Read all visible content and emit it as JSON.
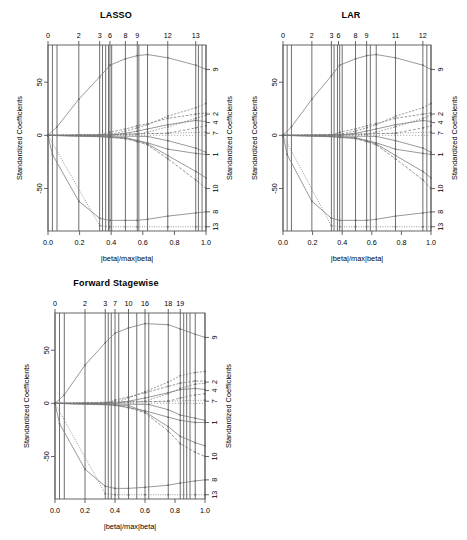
{
  "figure": {
    "background": "#ffffff",
    "width": 467,
    "height": 540,
    "axis_color": "#555555",
    "vline_color": "#4a4a4a",
    "path_color": "#777777"
  },
  "chart_data": [
    {
      "type": "line",
      "title": "LASSO",
      "xlabel": "|beta|/max|beta|",
      "ylabel": "Standardized Coefficients",
      "xlim": [
        0.0,
        1.0
      ],
      "ylim": [
        -90,
        85
      ],
      "grid": false,
      "legend": "right-axis-variable-index",
      "xticks": [
        0.0,
        0.2,
        0.4,
        0.6,
        0.8,
        1.0
      ],
      "xticklabels": [
        "0.0",
        "0.2",
        "0.4",
        "0.6",
        "0.8",
        "1.0"
      ],
      "yticks": [
        50,
        0,
        -50
      ],
      "yticklabels": [
        "50",
        "0",
        "-50"
      ],
      "top_axis_label": "Step",
      "top_ticks": [
        0.0,
        0.195,
        0.327,
        0.392,
        0.49,
        0.565,
        0.758,
        0.935
      ],
      "top_ticklabels": [
        "0",
        "2",
        "3",
        "6",
        "8",
        "9",
        "12",
        "13"
      ],
      "vlines": [
        0.0,
        0.028,
        0.057,
        0.195,
        0.327,
        0.345,
        0.365,
        0.383,
        0.392,
        0.403,
        0.49,
        0.565,
        0.575,
        0.63,
        0.758,
        0.935,
        0.952,
        0.975,
        1.0
      ],
      "right_ticks": [
        62,
        20,
        12,
        2,
        -18,
        -50,
        -72,
        -86
      ],
      "right_ticklabels": [
        "9",
        "2",
        "4",
        "7",
        "1",
        "10",
        "8",
        "13"
      ],
      "series": [
        {
          "name": "9",
          "x": [
            0.0,
            0.057,
            0.195,
            0.327,
            0.392,
            0.49,
            0.565,
            0.63,
            0.758,
            0.935,
            1.0
          ],
          "values": [
            0,
            8,
            34,
            55,
            66,
            72,
            75,
            76,
            73,
            66,
            62
          ]
        },
        {
          "name": "2",
          "x": [
            0.0,
            0.327,
            0.392,
            0.49,
            0.565,
            0.63,
            0.758,
            0.935,
            1.0
          ],
          "values": [
            0,
            0,
            3,
            6,
            9,
            11,
            16,
            20,
            21
          ]
        },
        {
          "name": "4",
          "x": [
            0.0,
            0.392,
            0.49,
            0.565,
            0.63,
            0.758,
            0.935,
            1.0
          ],
          "values": [
            0,
            0,
            2,
            4,
            6,
            10,
            14,
            13
          ]
        },
        {
          "name": "7",
          "x": [
            0.0,
            0.195,
            0.49,
            0.758,
            1.0
          ],
          "values": [
            0,
            0,
            1,
            2,
            3
          ]
        },
        {
          "name": "1",
          "x": [
            0.0,
            0.327,
            0.392,
            0.49,
            0.565,
            0.63,
            0.758,
            0.935,
            1.0
          ],
          "values": [
            0,
            -1,
            -2,
            -3,
            -5,
            -7,
            -13,
            -17,
            -18
          ]
        },
        {
          "name": "10",
          "x": [
            0.0,
            0.392,
            0.49,
            0.565,
            0.63,
            0.758,
            0.935,
            1.0
          ],
          "values": [
            0,
            -1,
            -3,
            -6,
            -9,
            -22,
            -42,
            -50
          ]
        },
        {
          "name": "8",
          "x": [
            0.0,
            0.028,
            0.195,
            0.327,
            0.392,
            0.49,
            0.565,
            0.63,
            0.758,
            0.935,
            1.0
          ],
          "values": [
            0,
            -18,
            -62,
            -78,
            -80,
            -80,
            -80,
            -79,
            -76,
            -73,
            -72
          ]
        },
        {
          "name": "13",
          "x": [
            0.0,
            0.327,
            0.392,
            0.49,
            0.565,
            0.758,
            0.935,
            1.0
          ],
          "values": [
            0,
            -85,
            -86,
            -86,
            -86,
            -86,
            -86,
            -86
          ]
        },
        {
          "name": "3",
          "x": [
            0.0,
            0.392,
            0.49,
            0.565,
            0.63,
            0.758,
            0.935,
            1.0
          ],
          "values": [
            0,
            1,
            4,
            7,
            10,
            18,
            26,
            30
          ]
        },
        {
          "name": "5",
          "x": [
            0.0,
            0.49,
            0.565,
            0.63,
            0.758,
            0.935,
            1.0
          ],
          "values": [
            0,
            -2,
            -5,
            -8,
            -19,
            -34,
            -40
          ]
        },
        {
          "name": "6",
          "x": [
            0.0,
            0.565,
            0.63,
            0.758,
            0.935,
            1.0
          ],
          "values": [
            0,
            1,
            3,
            8,
            16,
            19
          ]
        },
        {
          "name": "11",
          "x": [
            0.0,
            0.63,
            0.758,
            0.935,
            1.0
          ],
          "values": [
            0,
            -1,
            -5,
            -12,
            -16
          ]
        },
        {
          "name": "12",
          "x": [
            0.0,
            0.758,
            0.935,
            1.0
          ],
          "values": [
            0,
            2,
            7,
            9
          ]
        }
      ]
    },
    {
      "type": "line",
      "title": "LAR",
      "xlabel": "|beta|/max|beta|",
      "ylabel": "Standardized Coefficients",
      "xlim": [
        0.0,
        1.0
      ],
      "ylim": [
        -90,
        85
      ],
      "grid": false,
      "legend": "right-axis-variable-index",
      "xticks": [
        0.0,
        0.2,
        0.4,
        0.6,
        0.8,
        1.0
      ],
      "xticklabels": [
        "0.0",
        "0.2",
        "0.4",
        "0.6",
        "0.8",
        "1.0"
      ],
      "yticks": [
        50,
        0,
        -50
      ],
      "yticklabels": [
        "50",
        "0",
        "-50"
      ],
      "top_axis_label": "Step",
      "top_ticks": [
        0.0,
        0.195,
        0.327,
        0.375,
        0.49,
        0.565,
        0.76,
        0.945
      ],
      "top_ticklabels": [
        "0",
        "2",
        "3",
        "6",
        "8",
        "9",
        "11",
        "12"
      ],
      "vlines": [
        0.0,
        0.028,
        0.057,
        0.195,
        0.327,
        0.345,
        0.368,
        0.383,
        0.4,
        0.49,
        0.565,
        0.59,
        0.63,
        0.76,
        0.945,
        0.972,
        1.0
      ],
      "right_ticks": [
        62,
        20,
        12,
        2,
        -18,
        -50,
        -72,
        -86
      ],
      "right_ticklabels": [
        "9",
        "2",
        "4",
        "7",
        "1",
        "10",
        "8",
        "13"
      ],
      "series": [
        {
          "name": "9",
          "x": [
            0.0,
            0.057,
            0.195,
            0.327,
            0.383,
            0.49,
            0.565,
            0.63,
            0.76,
            0.945,
            1.0
          ],
          "values": [
            0,
            8,
            34,
            56,
            66,
            72,
            75,
            76,
            73,
            66,
            62
          ]
        },
        {
          "name": "2",
          "x": [
            0.0,
            0.327,
            0.383,
            0.49,
            0.565,
            0.63,
            0.76,
            0.945,
            1.0
          ],
          "values": [
            0,
            0,
            3,
            6,
            9,
            11,
            16,
            20,
            21
          ]
        },
        {
          "name": "4",
          "x": [
            0.0,
            0.383,
            0.49,
            0.565,
            0.63,
            0.76,
            0.945,
            1.0
          ],
          "values": [
            0,
            0,
            2,
            4,
            6,
            10,
            14,
            13
          ]
        },
        {
          "name": "7",
          "x": [
            0.0,
            0.195,
            0.49,
            0.76,
            1.0
          ],
          "values": [
            0,
            0,
            1,
            2,
            3
          ]
        },
        {
          "name": "1",
          "x": [
            0.0,
            0.327,
            0.383,
            0.49,
            0.565,
            0.63,
            0.76,
            0.945,
            1.0
          ],
          "values": [
            0,
            -1,
            -2,
            -3,
            -5,
            -7,
            -13,
            -17,
            -18
          ]
        },
        {
          "name": "10",
          "x": [
            0.0,
            0.383,
            0.49,
            0.565,
            0.63,
            0.76,
            0.945,
            1.0
          ],
          "values": [
            0,
            -1,
            -3,
            -6,
            -9,
            -22,
            -42,
            -50
          ]
        },
        {
          "name": "8",
          "x": [
            0.0,
            0.028,
            0.195,
            0.327,
            0.383,
            0.49,
            0.565,
            0.63,
            0.76,
            0.945,
            1.0
          ],
          "values": [
            0,
            -18,
            -62,
            -78,
            -80,
            -80,
            -80,
            -79,
            -76,
            -73,
            -72
          ]
        },
        {
          "name": "13",
          "x": [
            0.0,
            0.327,
            0.383,
            0.49,
            0.565,
            0.76,
            0.945,
            1.0
          ],
          "values": [
            0,
            -85,
            -86,
            -86,
            -86,
            -86,
            -86,
            -86
          ]
        },
        {
          "name": "3",
          "x": [
            0.0,
            0.383,
            0.49,
            0.565,
            0.63,
            0.76,
            0.945,
            1.0
          ],
          "values": [
            0,
            1,
            4,
            7,
            10,
            18,
            26,
            30
          ]
        },
        {
          "name": "5",
          "x": [
            0.0,
            0.49,
            0.565,
            0.63,
            0.76,
            0.945,
            1.0
          ],
          "values": [
            0,
            -2,
            -5,
            -8,
            -19,
            -34,
            -40
          ]
        },
        {
          "name": "6",
          "x": [
            0.0,
            0.565,
            0.63,
            0.76,
            0.945,
            1.0
          ],
          "values": [
            0,
            1,
            3,
            8,
            16,
            19
          ]
        },
        {
          "name": "11",
          "x": [
            0.0,
            0.63,
            0.76,
            0.945,
            1.0
          ],
          "values": [
            0,
            -1,
            -5,
            -12,
            -16
          ]
        },
        {
          "name": "12",
          "x": [
            0.0,
            0.76,
            0.945,
            1.0
          ],
          "values": [
            0,
            2,
            7,
            9
          ]
        }
      ]
    },
    {
      "type": "line",
      "title": "Forward Stagewise",
      "xlabel": "|beta|/max|beta|",
      "ylabel": "Standardized Coefficients",
      "xlim": [
        0.0,
        1.0
      ],
      "ylim": [
        -90,
        85
      ],
      "grid": false,
      "legend": "right-axis-variable-index",
      "xticks": [
        0.0,
        0.2,
        0.4,
        0.6,
        0.8,
        1.0
      ],
      "xticklabels": [
        "0.0",
        "0.2",
        "0.4",
        "0.6",
        "0.8",
        "1.0"
      ],
      "yticks": [
        50,
        0,
        -50
      ],
      "yticklabels": [
        "50",
        "0",
        "-50"
      ],
      "top_axis_label": "Step",
      "top_ticks": [
        0.0,
        0.2,
        0.335,
        0.4,
        0.49,
        0.6,
        0.755,
        0.835
      ],
      "top_ticklabels": [
        "0",
        "2",
        "3",
        "7",
        "10",
        "16",
        "18",
        "19"
      ],
      "vlines": [
        0.0,
        0.03,
        0.062,
        0.2,
        0.335,
        0.355,
        0.375,
        0.4,
        0.425,
        0.49,
        0.545,
        0.6,
        0.625,
        0.755,
        0.835,
        0.858,
        0.878,
        0.9,
        0.935,
        1.0
      ],
      "right_ticks": [
        62,
        20,
        12,
        2,
        -18,
        -50,
        -72,
        -86
      ],
      "right_ticklabels": [
        "9",
        "2",
        "4",
        "7",
        "1",
        "10",
        "8",
        "13"
      ],
      "series": [
        {
          "name": "9",
          "x": [
            0.0,
            0.062,
            0.2,
            0.335,
            0.4,
            0.49,
            0.6,
            0.755,
            0.835,
            0.935,
            1.0
          ],
          "values": [
            0,
            8,
            36,
            57,
            66,
            71,
            75,
            74,
            70,
            65,
            62
          ]
        },
        {
          "name": "2",
          "x": [
            0.0,
            0.335,
            0.4,
            0.49,
            0.6,
            0.755,
            0.835,
            0.935,
            1.0
          ],
          "values": [
            0,
            0,
            3,
            6,
            10,
            16,
            19,
            21,
            21
          ]
        },
        {
          "name": "4",
          "x": [
            0.0,
            0.4,
            0.49,
            0.6,
            0.755,
            0.835,
            0.935,
            1.0
          ],
          "values": [
            0,
            0,
            2,
            5,
            10,
            13,
            14,
            13
          ]
        },
        {
          "name": "7",
          "x": [
            0.0,
            0.2,
            0.49,
            0.755,
            1.0
          ],
          "values": [
            0,
            0,
            1,
            2,
            3
          ]
        },
        {
          "name": "1",
          "x": [
            0.0,
            0.335,
            0.4,
            0.49,
            0.6,
            0.755,
            0.835,
            0.935,
            1.0
          ],
          "values": [
            0,
            -1,
            -2,
            -4,
            -7,
            -13,
            -16,
            -18,
            -18
          ]
        },
        {
          "name": "10",
          "x": [
            0.0,
            0.4,
            0.49,
            0.6,
            0.755,
            0.835,
            0.935,
            1.0
          ],
          "values": [
            0,
            -1,
            -4,
            -9,
            -26,
            -38,
            -46,
            -50
          ]
        },
        {
          "name": "8",
          "x": [
            0.0,
            0.03,
            0.2,
            0.335,
            0.4,
            0.49,
            0.6,
            0.755,
            0.835,
            0.935,
            1.0
          ],
          "values": [
            0,
            -19,
            -62,
            -78,
            -80,
            -80,
            -79,
            -77,
            -75,
            -73,
            -72
          ]
        },
        {
          "name": "13",
          "x": [
            0.0,
            0.335,
            0.4,
            0.49,
            0.6,
            0.755,
            0.935,
            1.0
          ],
          "values": [
            0,
            -85,
            -86,
            -86,
            -86,
            -86,
            -86,
            -86
          ]
        },
        {
          "name": "3",
          "x": [
            0.0,
            0.4,
            0.49,
            0.6,
            0.755,
            0.835,
            0.935,
            1.0
          ],
          "values": [
            0,
            1,
            5,
            11,
            20,
            26,
            29,
            30
          ]
        },
        {
          "name": "5",
          "x": [
            0.0,
            0.49,
            0.6,
            0.755,
            0.835,
            0.935,
            1.0
          ],
          "values": [
            0,
            -2,
            -8,
            -22,
            -31,
            -37,
            -40
          ]
        },
        {
          "name": "6",
          "x": [
            0.0,
            0.6,
            0.755,
            0.835,
            0.935,
            1.0
          ],
          "values": [
            0,
            2,
            9,
            14,
            18,
            19
          ]
        },
        {
          "name": "11",
          "x": [
            0.0,
            0.625,
            0.755,
            0.835,
            0.935,
            1.0
          ],
          "values": [
            0,
            -1,
            -6,
            -11,
            -14,
            -16
          ]
        },
        {
          "name": "12",
          "x": [
            0.0,
            0.755,
            0.835,
            0.935,
            1.0
          ],
          "values": [
            0,
            2,
            5,
            8,
            9
          ]
        }
      ]
    }
  ]
}
